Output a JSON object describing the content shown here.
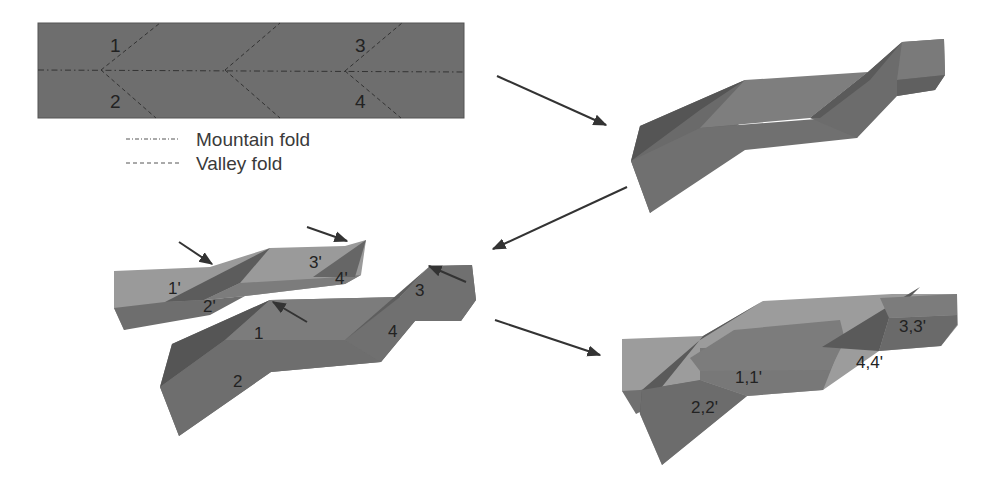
{
  "figure": {
    "colors": {
      "background": "#ffffff",
      "strip": "#6e6e6e",
      "face_light": "#9a9a9a",
      "face_mid": "#7d7d7d",
      "face_dark": "#666666",
      "face_darker": "#555555",
      "line": "#333333",
      "arrow": "#333333"
    },
    "flat_strip": {
      "labels": [
        "1",
        "2",
        "3",
        "4"
      ]
    },
    "legend": {
      "items": [
        {
          "line_style": "dash-dot",
          "label": "Mountain fold"
        },
        {
          "line_style": "dashed",
          "label": "Valley fold"
        }
      ]
    },
    "separated_pieces": {
      "upper_labels": [
        "1'",
        "2'",
        "3'",
        "4'"
      ],
      "lower_labels": [
        "1",
        "2",
        "3",
        "4"
      ]
    },
    "assembled": {
      "labels": [
        "1,1'",
        "2,2'",
        "3,3'",
        "4,4'"
      ]
    },
    "arrows": [
      {
        "from": "flat-strip",
        "to": "folded-piece",
        "direction": "down-right"
      },
      {
        "from": "folded-piece",
        "to": "separated-pieces",
        "direction": "down-left"
      },
      {
        "from": "separated-pieces",
        "to": "assembled",
        "direction": "down-right"
      }
    ]
  }
}
